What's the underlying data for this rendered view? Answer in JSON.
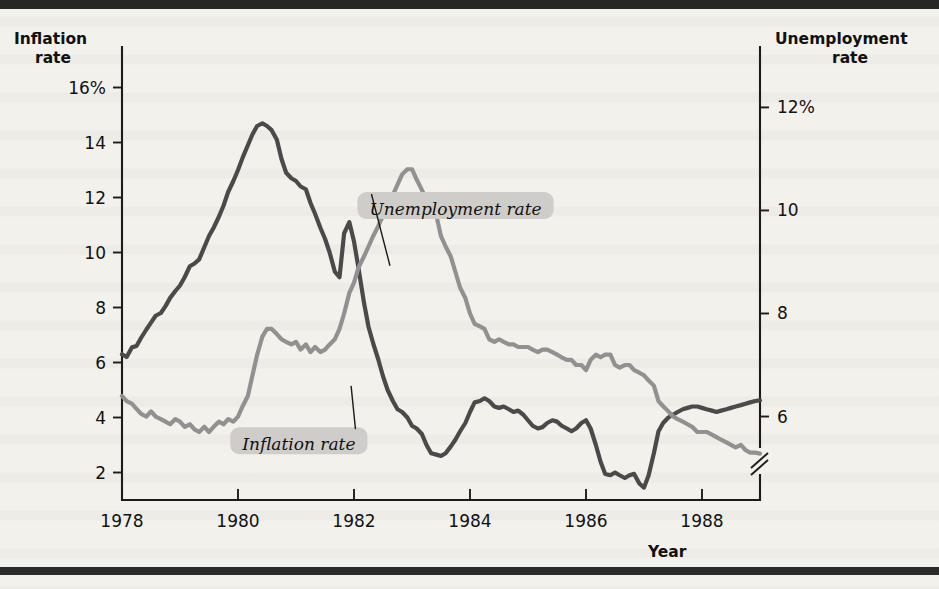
{
  "figure": {
    "left_axis_title_line1": "Inflation",
    "left_axis_title_line2": "rate",
    "right_axis_title_line1": "Unemployment",
    "right_axis_title_line2": "rate",
    "x_axis_title": "Year",
    "series_label_inflation": "Inflation rate",
    "series_label_unemployment": "Unemployment rate",
    "colors": {
      "inflation_line": "#4a4a4a",
      "unemployment_line": "#919191",
      "axis": "#1c1c1c",
      "label_pill": "#cfcdc9",
      "page_background": "#f3f1ec"
    }
  },
  "chart_data": {
    "type": "line",
    "title": "",
    "subtitle": "",
    "xlabel": "Year",
    "ylabel": "Inflation rate",
    "y2label": "Unemployment rate",
    "grid": false,
    "legend_position": "inline-annotation",
    "xlim": [
      1978,
      1989
    ],
    "xticks": [
      1978,
      1980,
      1982,
      1984,
      1986,
      1988
    ],
    "xticklabels": [
      "1978",
      "1980",
      "1982",
      "1984",
      "1986",
      "1988"
    ],
    "ylim": [
      1.0,
      17.0
    ],
    "yticks": [
      2,
      4,
      6,
      8,
      10,
      12,
      14,
      16
    ],
    "yticklabels": [
      "2",
      "4",
      "6",
      "8",
      "10",
      "12",
      "14",
      "16%"
    ],
    "y2lim": [
      4.38,
      12.92
    ],
    "y2ticks": [
      6,
      8,
      10,
      12
    ],
    "y2ticklabels": [
      "6",
      "8",
      "10",
      "12%"
    ],
    "y2_axis_break": true,
    "annotations": [
      {
        "text": "Inflation rate",
        "x": 1981.05,
        "y": 3.05
      },
      {
        "text": "Unemployment rate",
        "x": 1983.75,
        "y": 11.6
      }
    ],
    "series": [
      {
        "name": "Inflation rate",
        "axis": "left",
        "color": "#4a4a4a",
        "x": [
          1978.0,
          1978.08,
          1978.17,
          1978.25,
          1978.33,
          1978.42,
          1978.5,
          1978.58,
          1978.67,
          1978.75,
          1978.83,
          1978.92,
          1979.0,
          1979.08,
          1979.17,
          1979.25,
          1979.33,
          1979.42,
          1979.5,
          1979.58,
          1979.67,
          1979.75,
          1979.83,
          1979.92,
          1980.0,
          1980.08,
          1980.17,
          1980.25,
          1980.33,
          1980.42,
          1980.5,
          1980.58,
          1980.67,
          1980.75,
          1980.83,
          1980.92,
          1981.0,
          1981.08,
          1981.17,
          1981.25,
          1981.33,
          1981.42,
          1981.5,
          1981.58,
          1981.67,
          1981.75,
          1981.83,
          1981.92,
          1982.0,
          1982.08,
          1982.17,
          1982.25,
          1982.33,
          1982.42,
          1982.5,
          1982.58,
          1982.67,
          1982.75,
          1982.83,
          1982.92,
          1983.0,
          1983.08,
          1983.17,
          1983.25,
          1983.33,
          1983.42,
          1983.5,
          1983.58,
          1983.67,
          1983.75,
          1983.83,
          1983.92,
          1984.0,
          1984.08,
          1984.17,
          1984.25,
          1984.33,
          1984.42,
          1984.5,
          1984.58,
          1984.67,
          1984.75,
          1984.83,
          1984.92,
          1985.0,
          1985.08,
          1985.17,
          1985.25,
          1985.33,
          1985.42,
          1985.5,
          1985.58,
          1985.67,
          1985.75,
          1985.83,
          1985.92,
          1986.0,
          1986.08,
          1986.17,
          1986.25,
          1986.33,
          1986.42,
          1986.5,
          1986.58,
          1986.67,
          1986.75,
          1986.83,
          1986.92,
          1987.0,
          1987.08,
          1987.17,
          1987.25,
          1987.33,
          1987.42,
          1987.5,
          1987.58,
          1987.67,
          1987.75,
          1987.83,
          1987.92,
          1988.0,
          1988.08,
          1988.17,
          1988.25,
          1988.33,
          1988.42,
          1988.5,
          1988.58,
          1988.67,
          1988.75,
          1988.83,
          1988.92,
          1989.0
        ],
        "y": [
          6.3,
          6.2,
          6.55,
          6.6,
          6.9,
          7.2,
          7.45,
          7.7,
          7.8,
          8.05,
          8.35,
          8.6,
          8.8,
          9.1,
          9.5,
          9.6,
          9.75,
          10.2,
          10.6,
          10.9,
          11.3,
          11.7,
          12.2,
          12.6,
          13.0,
          13.45,
          13.9,
          14.3,
          14.6,
          14.7,
          14.6,
          14.45,
          14.1,
          13.4,
          12.9,
          12.7,
          12.6,
          12.4,
          12.3,
          11.8,
          11.4,
          10.9,
          10.5,
          10.0,
          9.3,
          9.1,
          10.7,
          11.1,
          10.4,
          9.4,
          8.2,
          7.3,
          6.7,
          6.1,
          5.5,
          5.0,
          4.6,
          4.3,
          4.2,
          4.0,
          3.7,
          3.6,
          3.4,
          3.0,
          2.7,
          2.65,
          2.6,
          2.7,
          2.95,
          3.2,
          3.5,
          3.8,
          4.2,
          4.55,
          4.6,
          4.7,
          4.6,
          4.4,
          4.35,
          4.4,
          4.3,
          4.2,
          4.25,
          4.1,
          3.9,
          3.7,
          3.6,
          3.65,
          3.8,
          3.9,
          3.85,
          3.7,
          3.6,
          3.5,
          3.6,
          3.8,
          3.9,
          3.6,
          3.0,
          2.4,
          1.95,
          1.9,
          2.0,
          1.9,
          1.8,
          1.9,
          1.95,
          1.6,
          1.45,
          1.9,
          2.7,
          3.5,
          3.8,
          4.0,
          4.1,
          4.2,
          4.3,
          4.35,
          4.4,
          4.4,
          4.35,
          4.3,
          4.25,
          4.2,
          4.25,
          4.3,
          4.35,
          4.4,
          4.45,
          4.5,
          4.55,
          4.6,
          4.62
        ]
      },
      {
        "name": "Unemployment rate",
        "axis": "right",
        "color": "#919191",
        "x": [
          1978.0,
          1978.08,
          1978.17,
          1978.25,
          1978.33,
          1978.42,
          1978.5,
          1978.58,
          1978.67,
          1978.75,
          1978.83,
          1978.92,
          1979.0,
          1979.08,
          1979.17,
          1979.25,
          1979.33,
          1979.42,
          1979.5,
          1979.58,
          1979.67,
          1979.75,
          1979.83,
          1979.92,
          1980.0,
          1980.08,
          1980.17,
          1980.25,
          1980.33,
          1980.42,
          1980.5,
          1980.58,
          1980.67,
          1980.75,
          1980.83,
          1980.92,
          1981.0,
          1981.08,
          1981.17,
          1981.25,
          1981.33,
          1981.42,
          1981.5,
          1981.58,
          1981.67,
          1981.75,
          1981.83,
          1981.92,
          1982.0,
          1982.08,
          1982.17,
          1982.25,
          1982.33,
          1982.42,
          1982.5,
          1982.58,
          1982.67,
          1982.75,
          1982.83,
          1982.92,
          1983.0,
          1983.08,
          1983.17,
          1983.25,
          1983.33,
          1983.42,
          1983.5,
          1983.58,
          1983.67,
          1983.75,
          1983.83,
          1983.92,
          1984.0,
          1984.08,
          1984.17,
          1984.25,
          1984.33,
          1984.42,
          1984.5,
          1984.58,
          1984.67,
          1984.75,
          1984.83,
          1984.92,
          1985.0,
          1985.08,
          1985.17,
          1985.25,
          1985.33,
          1985.42,
          1985.5,
          1985.58,
          1985.67,
          1985.75,
          1985.83,
          1985.92,
          1986.0,
          1986.08,
          1986.17,
          1986.25,
          1986.33,
          1986.42,
          1986.5,
          1986.58,
          1986.67,
          1986.75,
          1986.83,
          1986.92,
          1987.0,
          1987.08,
          1987.17,
          1987.25,
          1987.33,
          1987.42,
          1987.5,
          1987.58,
          1987.67,
          1987.75,
          1987.83,
          1987.92,
          1988.0,
          1988.08,
          1988.17,
          1988.25,
          1988.33,
          1988.42,
          1988.5,
          1988.58,
          1988.67,
          1988.75,
          1988.83,
          1988.92,
          1989.0
        ],
        "y": [
          6.4,
          6.3,
          6.25,
          6.15,
          6.05,
          6.0,
          6.1,
          6.0,
          5.95,
          5.9,
          5.85,
          5.95,
          5.9,
          5.8,
          5.85,
          5.75,
          5.7,
          5.8,
          5.7,
          5.8,
          5.9,
          5.85,
          5.95,
          5.9,
          6.0,
          6.2,
          6.4,
          6.8,
          7.2,
          7.55,
          7.7,
          7.7,
          7.6,
          7.5,
          7.45,
          7.4,
          7.45,
          7.3,
          7.4,
          7.25,
          7.35,
          7.25,
          7.3,
          7.4,
          7.5,
          7.7,
          8.0,
          8.4,
          8.6,
          8.9,
          9.1,
          9.3,
          9.5,
          9.7,
          9.9,
          10.1,
          10.3,
          10.5,
          10.7,
          10.8,
          10.8,
          10.6,
          10.4,
          10.2,
          10.1,
          9.9,
          9.5,
          9.3,
          9.1,
          8.8,
          8.5,
          8.3,
          8.0,
          7.8,
          7.75,
          7.7,
          7.5,
          7.45,
          7.5,
          7.45,
          7.4,
          7.4,
          7.35,
          7.35,
          7.35,
          7.3,
          7.25,
          7.3,
          7.3,
          7.25,
          7.2,
          7.15,
          7.1,
          7.1,
          7.0,
          7.0,
          6.9,
          7.1,
          7.2,
          7.15,
          7.2,
          7.2,
          7.0,
          6.95,
          7.0,
          7.0,
          6.9,
          6.85,
          6.8,
          6.7,
          6.6,
          6.3,
          6.2,
          6.1,
          6.0,
          5.95,
          5.9,
          5.85,
          5.8,
          5.7,
          5.7,
          5.7,
          5.65,
          5.6,
          5.55,
          5.5,
          5.45,
          5.4,
          5.45,
          5.35,
          5.3,
          5.3,
          5.28
        ]
      }
    ]
  }
}
